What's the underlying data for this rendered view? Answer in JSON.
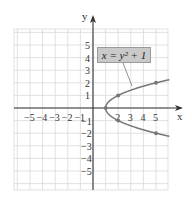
{
  "chart_data": {
    "type": "line",
    "title": "",
    "equation": "x = y² + 1",
    "xlabel": "x",
    "ylabel": "y",
    "xlim": [
      -6,
      6
    ],
    "ylim": [
      -6,
      6
    ],
    "grid": true,
    "x_tick_labels": [
      "−5",
      "−4",
      "−3",
      "−2",
      "−1",
      "2",
      "3",
      "4",
      "5"
    ],
    "y_tick_labels": [
      "5",
      "4",
      "3",
      "2",
      "1",
      "−1",
      "−2",
      "−3",
      "−4",
      "−5"
    ],
    "series": [
      {
        "name": "x = y² + 1",
        "points": [
          [
            1,
            0
          ],
          [
            2,
            1
          ],
          [
            2,
            -1
          ],
          [
            5,
            2
          ],
          [
            5,
            -2
          ]
        ],
        "marked_points": [
          [
            1,
            0
          ],
          [
            2,
            1
          ],
          [
            2,
            -1
          ],
          [
            5,
            2
          ],
          [
            5,
            -2
          ]
        ]
      }
    ],
    "colors": {
      "curve": "#777777",
      "grid": "#d9d9d9",
      "axis": "#333333",
      "label_box": "#c9c9c9"
    }
  },
  "labels": {
    "equation_box": "x = y² + 1",
    "x_axis": "x",
    "y_axis": "y"
  }
}
